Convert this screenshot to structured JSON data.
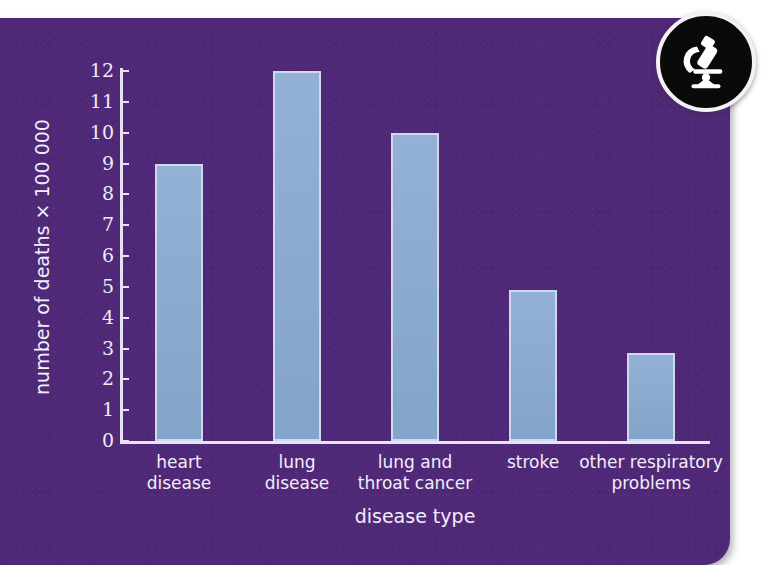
{
  "chart_data": {
    "type": "bar",
    "title": "",
    "xlabel": "disease type",
    "ylabel": "number of deaths × 100 000",
    "categories": [
      "heart\ndisease",
      "lung\ndisease",
      "lung and\nthroat cancer",
      "stroke",
      "other respiratory\nproblems"
    ],
    "category_lines": [
      [
        "heart",
        "disease"
      ],
      [
        "lung",
        "disease"
      ],
      [
        "lung and",
        "throat cancer"
      ],
      [
        "stroke",
        ""
      ],
      [
        "other respiratory",
        "problems"
      ]
    ],
    "values": [
      9,
      12,
      10,
      4.9,
      2.85
    ],
    "ylim": [
      0,
      12
    ],
    "ytick_labels": [
      "12",
      "11",
      "10",
      "9",
      "8",
      "7",
      "6",
      "5",
      "4",
      "3",
      "2",
      "1",
      "0"
    ],
    "ytick_values": [
      12,
      11,
      10,
      9,
      8,
      7,
      6,
      5,
      4,
      3,
      2,
      1,
      0
    ],
    "grid": false,
    "legend": "none",
    "bar_fill": "#8aaad2",
    "bar_border": "#cfd9ec",
    "axis_color": "#e8e3f0",
    "background": "#502878",
    "text_color": "#f2eef8"
  },
  "badge": {
    "icon": "microscope-icon",
    "background": "#0a0a0a",
    "ring": "#f4f2f7"
  }
}
